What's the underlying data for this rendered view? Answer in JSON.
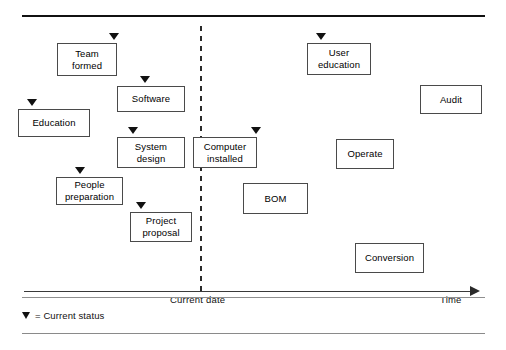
{
  "axis": {
    "time_label": "Time",
    "current_date_label": "Current date",
    "arrow_direction": "right"
  },
  "legend": {
    "marker_icon": "down-triangle-icon",
    "text": "= Current status"
  },
  "colors": {
    "line": "#2a2a2a",
    "box_border": "#4a4a4a",
    "marker": "#111111",
    "background": "#ffffff"
  },
  "milestones": [
    {
      "id": "team-formed",
      "label": "Team\nformed",
      "line1": "Team",
      "line2": "formed",
      "x": 57,
      "y": 43,
      "w": 60,
      "h": 33,
      "marker": true,
      "marker_x": 109,
      "marker_y": 33
    },
    {
      "id": "software",
      "label": "Software",
      "line1": "Software",
      "line2": "",
      "x": 117,
      "y": 86,
      "w": 68,
      "h": 26,
      "marker": true,
      "marker_x": 140,
      "marker_y": 76
    },
    {
      "id": "education",
      "label": "Education",
      "line1": "Education",
      "line2": "",
      "x": 18,
      "y": 109,
      "w": 72,
      "h": 28,
      "marker": true,
      "marker_x": 27,
      "marker_y": 99
    },
    {
      "id": "system-design",
      "label": "System\ndesign",
      "line1": "System",
      "line2": "design",
      "x": 117,
      "y": 137,
      "w": 68,
      "h": 31,
      "marker": true,
      "marker_x": 128,
      "marker_y": 127
    },
    {
      "id": "computer-installed",
      "label": "Computer\ninstalled",
      "line1": "Computer",
      "line2": "installed",
      "x": 193,
      "y": 137,
      "w": 64,
      "h": 31,
      "marker": true,
      "marker_x": 251,
      "marker_y": 127
    },
    {
      "id": "people-preparation",
      "label": "People\npreparation",
      "line1": "People",
      "line2": "preparation",
      "x": 56,
      "y": 177,
      "w": 67,
      "h": 28,
      "marker": true,
      "marker_x": 75,
      "marker_y": 167
    },
    {
      "id": "project-proposal",
      "label": "Project\nproposal",
      "line1": "Project",
      "line2": "proposal",
      "x": 130,
      "y": 212,
      "w": 62,
      "h": 30,
      "marker": true,
      "marker_x": 136,
      "marker_y": 202
    },
    {
      "id": "user-education",
      "label": "User\neducation",
      "line1": "User",
      "line2": "education",
      "x": 307,
      "y": 43,
      "w": 64,
      "h": 32,
      "marker": true,
      "marker_x": 316,
      "marker_y": 33
    },
    {
      "id": "audit",
      "label": "Audit",
      "line1": "Audit",
      "line2": "",
      "x": 420,
      "y": 85,
      "w": 62,
      "h": 29,
      "marker": false,
      "marker_x": 0,
      "marker_y": 0
    },
    {
      "id": "operate",
      "label": "Operate",
      "line1": "Operate",
      "line2": "",
      "x": 336,
      "y": 139,
      "w": 58,
      "h": 30,
      "marker": false,
      "marker_x": 0,
      "marker_y": 0
    },
    {
      "id": "bom",
      "label": "BOM",
      "line1": "BOM",
      "line2": "",
      "x": 243,
      "y": 183,
      "w": 65,
      "h": 31,
      "marker": false,
      "marker_x": 0,
      "marker_y": 0
    },
    {
      "id": "conversion",
      "label": "Conversion",
      "line1": "Conversion",
      "line2": "",
      "x": 355,
      "y": 243,
      "w": 69,
      "h": 30,
      "marker": false,
      "marker_x": 0,
      "marker_y": 0
    }
  ]
}
